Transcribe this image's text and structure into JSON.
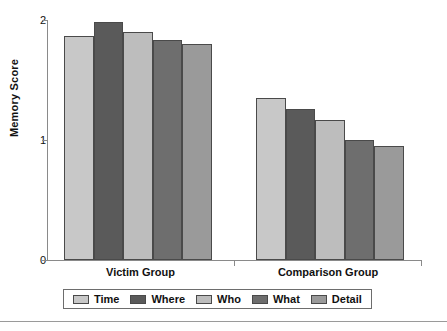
{
  "chart_data": {
    "type": "bar",
    "title": "",
    "subtitle": "",
    "xlabel": "",
    "ylabel": "Memory Score",
    "categories": [
      "Victim Group",
      "Comparison Group"
    ],
    "ylim": [
      0,
      2
    ],
    "yticks": [
      "0",
      "1",
      "2"
    ],
    "ytick_values": [
      0,
      1,
      2
    ],
    "grid": false,
    "legend_position": "bottom",
    "series": [
      {
        "name": "Time",
        "color": "#c8c8c8",
        "values": [
          1.87,
          1.35
        ]
      },
      {
        "name": "Where",
        "color": "#5a5a5a",
        "values": [
          1.98,
          1.26
        ]
      },
      {
        "name": "Who",
        "color": "#bdbdbd",
        "values": [
          1.9,
          1.17
        ]
      },
      {
        "name": "What",
        "color": "#6e6e6e",
        "values": [
          1.83,
          1.0
        ]
      },
      {
        "name": "Detail",
        "color": "#9a9a9a",
        "values": [
          1.8,
          0.95
        ]
      }
    ]
  },
  "axis": {
    "y_title": "Memory Score",
    "tick_0": "0",
    "tick_1": "1",
    "tick_2": "2"
  },
  "groups": {
    "left_label": "Victim Group",
    "right_label": "Comparison Group"
  },
  "legend": {
    "items": [
      {
        "label": "Time"
      },
      {
        "label": "Where"
      },
      {
        "label": "Who"
      },
      {
        "label": "What"
      },
      {
        "label": "Detail"
      }
    ]
  },
  "colors": {
    "axis": "#8a8a8a",
    "bar_outline": "#4a4a4a",
    "text": "#111111",
    "legend_border": "#6d6d6d",
    "rule": "#9a9a9a"
  }
}
